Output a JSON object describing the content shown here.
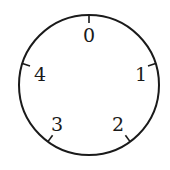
{
  "dial": {
    "center": [
      89,
      85
    ],
    "radius": 70,
    "stroke_color": "#1a1a1a",
    "positions": [
      {
        "label": "0",
        "angle_deg": 0
      },
      {
        "label": "1",
        "angle_deg": 72
      },
      {
        "label": "2",
        "angle_deg": 144
      },
      {
        "label": "3",
        "angle_deg": 216
      },
      {
        "label": "4",
        "angle_deg": 288
      }
    ]
  }
}
